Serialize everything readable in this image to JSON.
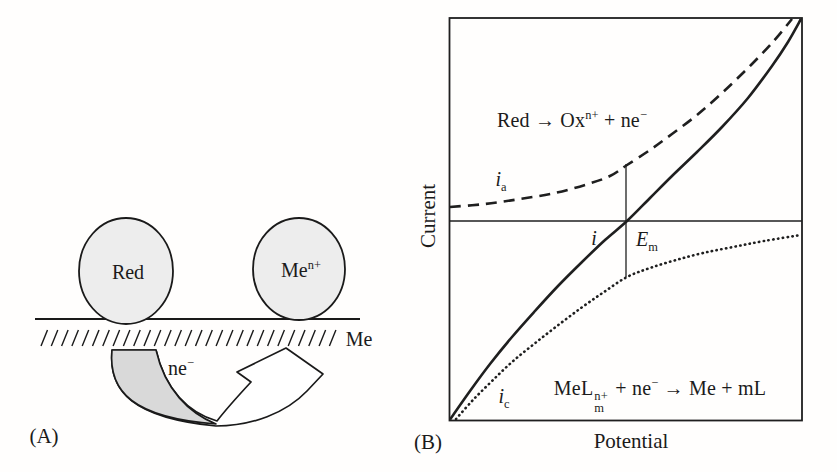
{
  "figure": {
    "panel_a": {
      "tag": "(A)",
      "labels": {
        "red_species": "Red",
        "ion_base": "Me",
        "ion_sup": "n+",
        "surface_metal": "Me",
        "electron_base": "ne",
        "electron_sup": "−"
      }
    },
    "panel_b": {
      "tag": "(B)",
      "axes": {
        "y": "Current",
        "x": "Potential"
      },
      "reactions": {
        "anodic": {
          "t1": "Red → Ox",
          "s1": "n+",
          "t2": " + ne",
          "s2": "−"
        },
        "cathodic": {
          "t1": "MeL",
          "stack_sup": "n+",
          "stack_sub": "m",
          "t2": " + ne",
          "s2": "−",
          "t3": " → Me + mL"
        }
      },
      "curve_labels": {
        "ia_base": "i",
        "ia_sub": "a",
        "total": "i",
        "em_base": "E",
        "em_sub": "m",
        "ic_base": "i",
        "ic_sub": "c"
      }
    }
  },
  "chart_data": {
    "type": "line",
    "xlabel": "Potential",
    "ylabel": "Current",
    "axes_numeric": false,
    "grid": false,
    "legend_position": "none",
    "annotations": [
      "E_m is the mixed potential where the total current i crosses zero",
      "i_a: anodic partial current for Red → Ox(n+) + ne−",
      "i_c: cathodic partial current for MeL_m(n+) + ne− → Me + mL"
    ],
    "series": [
      {
        "name": "i_a (anodic partial current)",
        "style": "dashed",
        "points_px": [
          [
            450,
            207
          ],
          [
            485,
            204
          ],
          [
            520,
            199
          ],
          [
            555,
            193
          ],
          [
            588,
            184
          ],
          [
            610,
            176
          ],
          [
            627,
            165
          ],
          [
            650,
            150
          ],
          [
            672,
            134
          ],
          [
            697,
            115
          ],
          [
            722,
            93
          ],
          [
            748,
            68
          ],
          [
            772,
            43
          ],
          [
            792,
            19
          ]
        ]
      },
      {
        "name": "i (total current)",
        "style": "solid",
        "points_px": [
          [
            450,
            419.5
          ],
          [
            470,
            391
          ],
          [
            490,
            364
          ],
          [
            512,
            337
          ],
          [
            535,
            311
          ],
          [
            558,
            286
          ],
          [
            582,
            262
          ],
          [
            605,
            240
          ],
          [
            627,
            221
          ],
          [
            650,
            198
          ],
          [
            672,
            176
          ],
          [
            697,
            152
          ],
          [
            722,
            127
          ],
          [
            748,
            98
          ],
          [
            772,
            66
          ],
          [
            788,
            42
          ],
          [
            801,
            19
          ]
        ]
      },
      {
        "name": "i_c (cathodic partial current)",
        "style": "dotted",
        "points_px": [
          [
            456,
            419
          ],
          [
            473,
            400
          ],
          [
            492,
            381
          ],
          [
            512,
            362
          ],
          [
            534,
            344
          ],
          [
            557,
            326
          ],
          [
            581,
            308
          ],
          [
            604,
            292
          ],
          [
            627,
            277
          ],
          [
            650,
            268
          ],
          [
            676,
            260
          ],
          [
            703,
            253
          ],
          [
            733,
            247
          ],
          [
            764,
            241
          ],
          [
            801,
            235
          ]
        ]
      }
    ],
    "zero_current_line_px": [
      [
        449.5,
        221
      ],
      [
        802,
        221
      ]
    ],
    "mixed_potential_marker_px": [
      [
        626,
        164
      ],
      [
        626,
        277
      ]
    ],
    "plot_box_px": {
      "left": 449.5,
      "top": 18,
      "right": 802,
      "bottom": 420.5
    }
  }
}
